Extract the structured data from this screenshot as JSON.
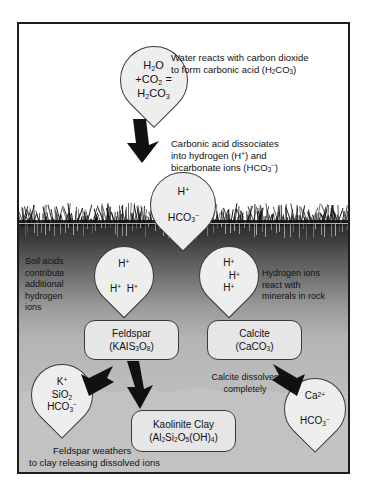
{
  "diagram": {
    "colors": {
      "drop_fill": "#eeeeee",
      "box_fill": "#e6e6e6",
      "outline": "#3a3a3a",
      "frame": "#1c1c1c",
      "soil_dark": "#2b2b2b",
      "rock_light": "#c2c2c2",
      "text": "#111111"
    }
  },
  "drops": {
    "rain": {
      "line1_pre": "H",
      "line1_sub": "2",
      "line1_post": "O",
      "line2": "+CO2 =",
      "line3": "H2CO3",
      "label_plain": "H2O +CO2 = H2CO3"
    },
    "acid": {
      "line1": "H+",
      "line2": "HCO3-"
    },
    "soil_left": {
      "ions": [
        "H+",
        "H+",
        "H+"
      ]
    },
    "soil_right": {
      "ions": [
        "H+",
        "H+",
        "H+"
      ]
    },
    "feldspar_products": {
      "line1": "K+",
      "line2": "SiO2",
      "line3": "HCO3-"
    },
    "calcite_products": {
      "line1": "Ca2+",
      "line2": "HCO3-"
    }
  },
  "boxes": {
    "feldspar": {
      "name": "Feldspar",
      "formula": "(KAIS3O8)"
    },
    "calcite": {
      "name": "Calcite",
      "formula": "(CaCO3)"
    },
    "kaolinite": {
      "name": "Kaolinite Clay",
      "formula": "(Al2Si2O5(OH)4)"
    }
  },
  "captions": {
    "water_reacts": [
      "Water reacts with carbon dioxide",
      "to form carbonic acid (H2CO3)"
    ],
    "dissociates": [
      "Carbonic acid dissociates",
      "into hydrogen (H+) and",
      "bicarbonate ions (HCO3-)"
    ],
    "soil_acids": [
      "Soil acids",
      "contribute",
      "additional",
      "hydrogen",
      "ions"
    ],
    "hydrogen_react": [
      "Hydrogen ions",
      "react with",
      "minerals in rock"
    ],
    "calcite_dissolves": [
      "Calcite dissolves",
      "completely"
    ],
    "feldspar_weathers": [
      "Feldspar weathers",
      "to clay releasing dissolved ions"
    ]
  }
}
